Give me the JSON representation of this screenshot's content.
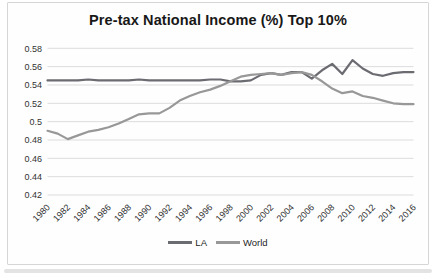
{
  "page": {
    "background_color": "#ffffff",
    "bottom_strip_color": "#e3e3e3",
    "frame_border_color": "#d6d6d6"
  },
  "chart_data": {
    "type": "line",
    "title": "Pre-tax National Income (%) Top 10%",
    "x": [
      1980,
      1981,
      1982,
      1983,
      1984,
      1985,
      1986,
      1987,
      1988,
      1989,
      1990,
      1991,
      1992,
      1993,
      1994,
      1995,
      1996,
      1997,
      1998,
      1999,
      2000,
      2001,
      2002,
      2003,
      2004,
      2005,
      2006,
      2007,
      2008,
      2009,
      2010,
      2011,
      2012,
      2013,
      2014,
      2015,
      2016
    ],
    "x_tick_labels": [
      "1980",
      "1982",
      "1984",
      "1986",
      "1988",
      "1990",
      "1992",
      "1994",
      "1996",
      "1998",
      "2000",
      "2002",
      "2004",
      "2006",
      "2008",
      "2010",
      "2012",
      "2014",
      "2016"
    ],
    "y_tick_labels": [
      "0.58",
      "0.56",
      "0.54",
      "0.52",
      "0.5",
      "0.48",
      "0.46",
      "0.44",
      "0.42"
    ],
    "ylim": [
      0.42,
      0.58
    ],
    "y_tick_step": 0.02,
    "grid": true,
    "gridline_color": "#dcdcdc",
    "axis_label_color": "#333333",
    "legend_position": "bottom",
    "series": [
      {
        "name": "LA",
        "color": "#6b6b72",
        "values": [
          0.545,
          0.545,
          0.545,
          0.545,
          0.546,
          0.545,
          0.545,
          0.545,
          0.545,
          0.546,
          0.545,
          0.545,
          0.545,
          0.545,
          0.545,
          0.545,
          0.546,
          0.546,
          0.544,
          0.544,
          0.545,
          0.551,
          0.553,
          0.551,
          0.554,
          0.554,
          0.547,
          0.556,
          0.563,
          0.552,
          0.567,
          0.558,
          0.552,
          0.55,
          0.553,
          0.554,
          0.554
        ]
      },
      {
        "name": "World",
        "color": "#989898",
        "values": [
          0.49,
          0.487,
          0.481,
          0.485,
          0.489,
          0.491,
          0.494,
          0.498,
          0.503,
          0.508,
          0.509,
          0.509,
          0.515,
          0.523,
          0.528,
          0.532,
          0.535,
          0.539,
          0.544,
          0.549,
          0.551,
          0.552,
          0.553,
          0.551,
          0.553,
          0.554,
          0.551,
          0.544,
          0.536,
          0.531,
          0.533,
          0.528,
          0.526,
          0.523,
          0.52,
          0.519,
          0.519
        ]
      }
    ]
  }
}
